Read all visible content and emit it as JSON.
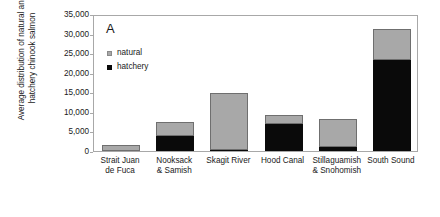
{
  "chart_data": {
    "type": "bar",
    "subtype": "stacked",
    "title": "",
    "panel_label": "A",
    "xlabel": "",
    "ylabel": "Average distribution of natural and\nhatchery chinook salmon",
    "ylim": [
      0,
      35000
    ],
    "ytick_values": [
      0,
      5000,
      10000,
      15000,
      20000,
      25000,
      30000,
      35000
    ],
    "ytick_labels": [
      "0",
      "5,000",
      "10,000",
      "15,000",
      "20,000",
      "25,000",
      "30,000",
      "35,000"
    ],
    "grid": false,
    "legend_position": "top-left",
    "categories": [
      "Strait Juan\nde Fuca",
      "Nooksack\n& Samish",
      "Skagit River",
      "Hood Canal",
      "Stillaguamish\n& Snohomish",
      "South Sound"
    ],
    "series": [
      {
        "name": "hatchery",
        "color": "#0a0a0a",
        "values": [
          0,
          3900,
          300,
          7000,
          900,
          23200
        ]
      },
      {
        "name": "natural",
        "color": "#a8a8a8",
        "values": [
          1500,
          3600,
          14500,
          2200,
          7300,
          8100
        ]
      }
    ],
    "totals": [
      1500,
      7500,
      14800,
      9200,
      8200,
      31300
    ]
  },
  "legend": {
    "items": [
      {
        "label": "natural",
        "swatch": "natural-swatch-icon"
      },
      {
        "label": "hatchery",
        "swatch": "hatchery-swatch-icon"
      }
    ]
  },
  "colors": {
    "natural": "#a8a8a8",
    "hatchery": "#0a0a0a",
    "axis": "#a8a8a8",
    "text": "#1a1a1a",
    "background": "#ffffff"
  }
}
